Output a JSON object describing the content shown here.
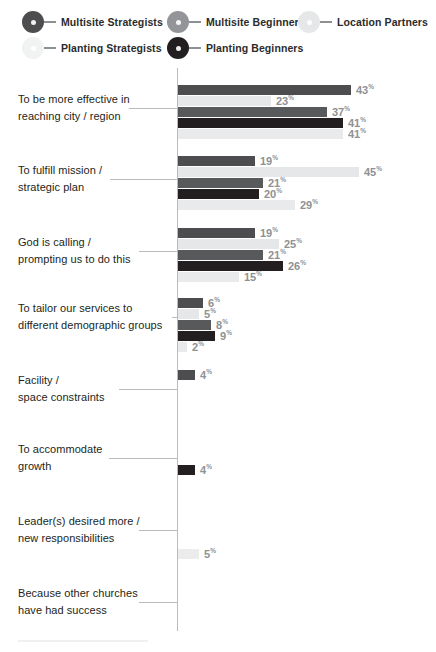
{
  "legend": {
    "items": [
      {
        "label": "Multisite Strategists",
        "color": "#4d4d4f",
        "icon": "series-marker-icon",
        "x": 22,
        "y": 11
      },
      {
        "label": "Multisite Beginners",
        "color": "#939598",
        "icon": "series-marker-icon",
        "x": 167,
        "y": 11
      },
      {
        "label": "Location Partners",
        "color": "#e6e7e8",
        "icon": "series-marker-icon",
        "x": 298,
        "y": 11
      },
      {
        "label": "Planting Strategists",
        "color": "#f1f2f2",
        "icon": "series-marker-icon",
        "x": 22,
        "y": 37
      },
      {
        "label": "Planting Beginners",
        "color": "#231f20",
        "icon": "series-marker-icon",
        "x": 167,
        "y": 37
      }
    ]
  },
  "chart_data": {
    "type": "bar",
    "orientation": "horizontal",
    "title": "",
    "xlabel": "",
    "ylabel": "",
    "xlim": [
      0,
      50
    ],
    "grid": false,
    "value_suffix": "%",
    "legend_position": "top",
    "series": [
      {
        "name": "Multisite Strategists",
        "color": "#4d4d4f",
        "values": [
          43,
          19,
          19,
          6,
          4,
          null,
          null,
          null
        ]
      },
      {
        "name": "Multisite Beginners",
        "color": "#939598",
        "values": [
          null,
          null,
          null,
          8,
          null,
          null,
          null,
          null
        ]
      },
      {
        "name": "Location Partners",
        "color": "#e6e7e8",
        "values": [
          23,
          45,
          25,
          5,
          null,
          null,
          5,
          null
        ]
      },
      {
        "name": "Planting Strategists",
        "color": "#f1f2f2",
        "values": [
          41,
          29,
          15,
          2,
          null,
          null,
          null,
          null
        ]
      },
      {
        "name": "Planting Beginners",
        "color": "#231f20",
        "values": [
          41,
          20,
          26,
          9,
          null,
          4,
          null,
          null
        ]
      }
    ],
    "categories": [
      "To be more effective in reaching city / region",
      "To fulfill mission / strategic plan",
      "God is calling / prompting us to do this",
      "To tailor our services to different demographic groups",
      "Facility / space constraints",
      "To accommodate growth",
      "Leader(s) desired more / new responsibilities",
      "Because other churches have had success"
    ],
    "groups": [
      {
        "label_lines": [
          "To be more effective in",
          "reaching city / region"
        ],
        "top": 17,
        "label_top": 23,
        "leader_top": 40,
        "leader_left": 129,
        "leader_width": 49,
        "bars": [
          {
            "series": "Multisite Strategists",
            "value": 43,
            "color": "#4d4d4f",
            "width": 173
          },
          {
            "series": "Location Partners",
            "value": 23,
            "color": "#e6e7e8",
            "width": 93
          },
          {
            "series": "Multisite Beginners",
            "value": 37,
            "color": "#58595b",
            "width": 149
          },
          {
            "series": "Planting Beginners",
            "value": 41,
            "color": "#231f20",
            "width": 165
          },
          {
            "series": "Planting Strategists",
            "value": 41,
            "color": "#e9eaeb",
            "width": 165
          }
        ]
      },
      {
        "label_lines": [
          "To fulfill mission /",
          "strategic plan"
        ],
        "top": 88,
        "label_top": 94,
        "leader_top": 111,
        "leader_left": 110,
        "leader_width": 68,
        "bars": [
          {
            "series": "Multisite Strategists",
            "value": 19,
            "color": "#4d4d4f",
            "width": 77
          },
          {
            "series": "Location Partners",
            "value": 45,
            "color": "#e6e7e8",
            "width": 181
          },
          {
            "series": "Multisite Beginners",
            "value": 21,
            "color": "#58595b",
            "width": 85
          },
          {
            "series": "Planting Beginners",
            "value": 20,
            "color": "#231f20",
            "width": 81
          },
          {
            "series": "Planting Strategists",
            "value": 29,
            "color": "#e9eaeb",
            "width": 117
          }
        ]
      },
      {
        "label_lines": [
          "God is calling /",
          "prompting us to do this"
        ],
        "top": 160,
        "label_top": 166,
        "leader_top": 183,
        "leader_left": 139,
        "leader_width": 39,
        "bars": [
          {
            "series": "Multisite Strategists",
            "value": 19,
            "color": "#4d4d4f",
            "width": 77
          },
          {
            "series": "Location Partners",
            "value": 25,
            "color": "#e6e7e8",
            "width": 101
          },
          {
            "series": "Multisite Beginners",
            "value": 21,
            "color": "#58595b",
            "width": 85
          },
          {
            "series": "Planting Beginners",
            "value": 26,
            "color": "#231f20",
            "width": 105
          },
          {
            "series": "Planting Strategists",
            "value": 15,
            "color": "#e9eaeb",
            "width": 61
          }
        ]
      },
      {
        "label_lines": [
          "To tailor our services to",
          "different demographic groups"
        ],
        "top": 230,
        "label_top": 232,
        "leader_top": 249,
        "leader_left": 172,
        "leader_width": 6,
        "bars": [
          {
            "series": "Multisite Strategists",
            "value": 6,
            "color": "#4d4d4f",
            "width": 25
          },
          {
            "series": "Location Partners",
            "value": 5,
            "color": "#e6e7e8",
            "width": 21
          },
          {
            "series": "Multisite Beginners",
            "value": 8,
            "color": "#58595b",
            "width": 33
          },
          {
            "series": "Planting Beginners",
            "value": 9,
            "color": "#231f20",
            "width": 37
          },
          {
            "series": "Planting Strategists",
            "value": 2,
            "color": "#e9eaeb",
            "width": 9
          }
        ]
      },
      {
        "label_lines": [
          "Facility /",
          "space constraints"
        ],
        "top": 302,
        "label_top": 304,
        "leader_top": 321,
        "leader_left": 119,
        "leader_width": 59,
        "bars": [
          {
            "series": "Multisite Strategists",
            "value": 4,
            "color": "#4d4d4f",
            "width": 17
          }
        ]
      },
      {
        "label_lines": [
          "To accommodate",
          "growth"
        ],
        "top": 375,
        "label_top": 373,
        "leader_top": 390,
        "leader_left": 109,
        "leader_width": 69,
        "bars": [
          {
            "series": "Planting Beginners",
            "value": 4,
            "color": "#231f20",
            "width": 17,
            "offset_top": 22
          }
        ]
      },
      {
        "label_lines": [
          "Leader(s) desired more /",
          "new responsibilities"
        ],
        "top": 448,
        "label_top": 445,
        "leader_top": 462,
        "leader_left": 139,
        "leader_width": 39,
        "bars": [
          {
            "series": "Location Partners",
            "value": 5,
            "color": "#ececed",
            "width": 21,
            "offset_top": 33
          }
        ]
      },
      {
        "label_lines": [
          "Because other churches",
          "have had success"
        ],
        "top": 518,
        "label_top": 517,
        "leader_top": 534,
        "leader_left": 139,
        "leader_width": 39,
        "bars": []
      }
    ]
  }
}
